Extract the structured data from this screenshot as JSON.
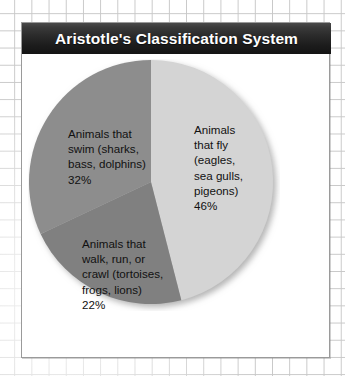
{
  "card": {
    "title": "Aristotle's Classification System"
  },
  "chart_data": {
    "type": "pie",
    "title": "Aristotle's Classification System",
    "xlabel": "",
    "ylabel": "",
    "legend_position": "none",
    "grid": false,
    "start_angle_deg": 0,
    "direction": "clockwise",
    "categories": [
      "Animals that fly (eagles, sea gulls, pigeons)",
      "Animals that walk, run, or crawl (tortoises, frogs, lions)",
      "Animals that swim (sharks, bass, dolphins)"
    ],
    "values": [
      46,
      22,
      32
    ],
    "units": "%",
    "slices": [
      {
        "key": "fly",
        "label": "Animals\nthat fly\n(eagles,\nsea gulls,\npigeons)\n46%",
        "name": "Animals that fly",
        "examples": "eagles, sea gulls, pigeons",
        "value": 46,
        "value_text": "46%",
        "color": "#d4d4d4"
      },
      {
        "key": "walk",
        "label": "Animals that\nwalk, run, or\ncrawl (tortoises,\nfrogs, lions)\n22%",
        "name": "Animals that walk, run, or crawl",
        "examples": "tortoises, frogs, lions",
        "value": 22,
        "value_text": "22%",
        "color": "#808080"
      },
      {
        "key": "swim",
        "label": "Animals that\nswim (sharks,\nbass, dolphins)\n32%",
        "name": "Animals that swim",
        "examples": "sharks, bass, dolphins",
        "value": 32,
        "value_text": "32%",
        "color": "#8d8d8d"
      }
    ],
    "colors": {
      "fly": "#d4d4d4",
      "walk": "#808080",
      "swim": "#8d8d8d",
      "title_bar_dark": "#1c1c1c",
      "title_text": "#ffffff",
      "card_border": "#9a9a9a",
      "grid_line": "#c8c8c8"
    }
  }
}
